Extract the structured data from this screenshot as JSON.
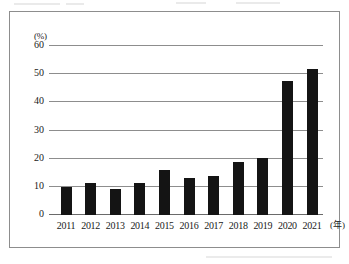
{
  "chart_data": {
    "type": "bar",
    "title": "",
    "subtitle": "",
    "xlabel": "(年)",
    "ylabel": "(%)",
    "categories": [
      "2011",
      "2012",
      "2013",
      "2014",
      "2015",
      "2016",
      "2017",
      "2018",
      "2019",
      "2020",
      "2021"
    ],
    "values": [
      9.8,
      11.4,
      9.3,
      11.3,
      16.0,
      13.1,
      13.8,
      18.8,
      20.2,
      47.6,
      52.0
    ],
    "ylim": [
      0,
      60
    ],
    "yticks": [
      0,
      10,
      20,
      30,
      40,
      50,
      60
    ],
    "ytick_labels": [
      "0",
      "10",
      "20",
      "30",
      "40",
      "50",
      "60"
    ],
    "grid": true,
    "legend": false,
    "legend_position": "none",
    "series": [
      {
        "name": "",
        "values": [
          9.8,
          11.4,
          9.3,
          11.3,
          16.0,
          13.1,
          13.8,
          18.8,
          20.2,
          47.6,
          52.0
        ]
      }
    ]
  },
  "style": {
    "bar_color": "#141414",
    "grid_color": "#8d8d8d",
    "frame_color": "#8d8d8d",
    "background": "#ffffff",
    "text_color": "#1a1a1a"
  }
}
